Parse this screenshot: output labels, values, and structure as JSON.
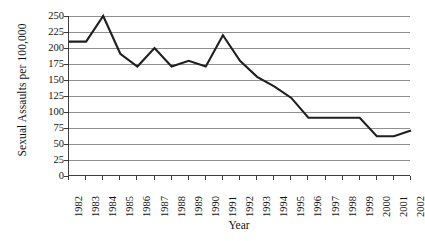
{
  "chart_data": {
    "type": "line",
    "title": "",
    "xlabel": "Year",
    "ylabel": "Sexual Assaults per 100,000",
    "categories": [
      "1982",
      "1983",
      "1984",
      "1985",
      "1986",
      "1987",
      "1988",
      "1989",
      "1990",
      "1991",
      "1992",
      "1993",
      "1994",
      "1995",
      "1996",
      "1997",
      "1998",
      "1999",
      "2000",
      "2001",
      "2002"
    ],
    "values": [
      210,
      210,
      250,
      191,
      171,
      200,
      171,
      180,
      171,
      220,
      180,
      155,
      140,
      122,
      91,
      91,
      91,
      91,
      62,
      62,
      71
    ],
    "series": [
      {
        "name": "Sexual Assaults per 100,000",
        "values": [
          210,
          210,
          250,
          191,
          171,
          200,
          171,
          180,
          171,
          220,
          180,
          155,
          140,
          122,
          91,
          91,
          91,
          91,
          62,
          62,
          71
        ]
      }
    ],
    "ylim": [
      0,
      250
    ],
    "yticks": [
      0,
      25,
      50,
      75,
      100,
      125,
      150,
      175,
      200,
      225,
      250
    ],
    "ytick_labels": [
      "0",
      "25",
      "50",
      "75",
      "100",
      "125",
      "150",
      "175",
      "200",
      "225",
      "250"
    ],
    "grid": true,
    "grid_axis": "y",
    "legend": false,
    "legend_position": "none",
    "line_color": "#1f1f1f",
    "grid_color": "#8f8f8f",
    "axis_color": "#3d3d3d",
    "background_color": "#ffffff",
    "markers": false
  }
}
